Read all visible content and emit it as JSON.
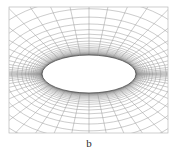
{
  "figure": {
    "caption": "b",
    "background_color": "#ffffff",
    "frame": {
      "x": 9,
      "y": 7,
      "width": 159,
      "height": 126,
      "stroke_color": "#b9b9b9",
      "stroke_width": 0.7,
      "visible": true
    },
    "mesh": {
      "type": "elliptic-o-grid",
      "line_color": "#8c8c8c",
      "line_width": 0.45,
      "radial_line_count": 64,
      "ring_count": 34,
      "clustering": "geometric-stretching-from-surface",
      "stretching_ratio": 1.22,
      "far_field_shape": "rectangular-clipped"
    },
    "body": {
      "name": "ellipse-airfoil",
      "shape": "ellipse",
      "center_x": 89,
      "center_y": 74,
      "semi_major_axis": 47,
      "semi_minor_axis": 19,
      "aspect_ratio": 0.4,
      "fill_color": "#ffffff",
      "outline_color": "#4a4a4a",
      "outline_width": 0.8
    }
  },
  "chart_data": {
    "type": "line",
    "title": "b",
    "xlabel": "",
    "ylabel": "",
    "grid": true,
    "legend": "none",
    "xlim": [
      9,
      168
    ],
    "ylim": [
      7,
      133
    ],
    "series": [
      {
        "name": "radial-lines",
        "count": 64,
        "origin": "ellipse-surface",
        "terminus": "rectangular-far-field"
      },
      {
        "name": "circumferential-rings",
        "count": 34,
        "shape": "confocal-ellipses",
        "innermost_semi_axes": [
          47,
          19
        ],
        "outermost_semi_axes": [
          230,
          172
        ]
      }
    ]
  }
}
